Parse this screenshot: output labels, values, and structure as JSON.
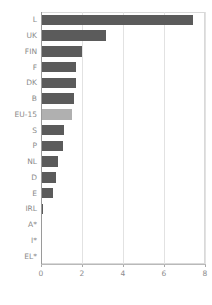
{
  "chart_data": {
    "type": "bar",
    "orientation": "horizontal",
    "title": "",
    "subtitle": "",
    "xlabel": "",
    "ylabel": "",
    "xlim": [
      0,
      8
    ],
    "ylim": null,
    "grid": true,
    "legend": null,
    "xticks": [
      "0",
      "2",
      "4",
      "6",
      "8"
    ],
    "xtick_values": [
      0,
      2,
      4,
      6,
      8
    ],
    "categories": [
      "L",
      "UK",
      "FIN",
      "F",
      "DK",
      "B",
      "EU-15",
      "S",
      "P",
      "NL",
      "D",
      "E",
      "IRL",
      "A*",
      "I*",
      "EL*"
    ],
    "values": [
      7.4,
      3.15,
      1.98,
      1.7,
      1.73,
      1.62,
      1.5,
      1.14,
      1.08,
      0.82,
      0.72,
      0.6,
      0.1,
      0.0,
      0.0,
      0.0
    ],
    "highlight_category": "EU-15",
    "colors": {
      "bar": "#5b5b5b",
      "highlight_bar": "#b0b0b0",
      "grid": "#e2e2e2",
      "axis": "#9a9a9a",
      "tick_text": "#8d8d8d",
      "category_text": "#8a8a8a",
      "background": "#ffffff"
    }
  }
}
